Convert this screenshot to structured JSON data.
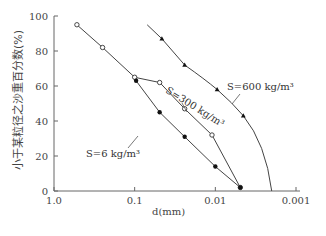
{
  "chart_data": {
    "type": "line",
    "title": "",
    "xlabel": "d(mm)",
    "ylabel": "小于某粒径之沙重百分数(%)",
    "x_scale": "log",
    "x_reversed": true,
    "xlim": [
      1.0,
      0.001
    ],
    "ylim": [
      0,
      100
    ],
    "x_ticks": [
      "1.0",
      "0.1",
      "0.01",
      "0.001"
    ],
    "y_ticks": [
      "0",
      "20",
      "40",
      "60",
      "80",
      "100"
    ],
    "grid": false,
    "legend": "none (inline annotations)",
    "series": [
      {
        "name": "S=300 kg/m³",
        "marker": "open-circle",
        "x": [
          0.52,
          0.25,
          0.1,
          0.049,
          0.024,
          0.011,
          0.0049
        ],
        "y": [
          95,
          82,
          65,
          62,
          47,
          32,
          2
        ]
      },
      {
        "name": "S=6 kg/m³",
        "marker": "filled-circle",
        "x": [
          0.096,
          0.049,
          0.024,
          0.01,
          0.0049
        ],
        "y": [
          63,
          45,
          31,
          14,
          2
        ]
      },
      {
        "name": "S=600 kg/m³",
        "marker": "filled-triangle",
        "x": [
          0.046,
          0.024,
          0.0095,
          0.0045,
          0.002
        ],
        "y": [
          87,
          72,
          58,
          43,
          0
        ]
      }
    ],
    "annotations": [
      {
        "text": "S=6 kg/m³",
        "near_series": "S=6 kg/m³"
      },
      {
        "text": "S=300 kg/m³",
        "near_series": "S=300 kg/m³"
      },
      {
        "text": "S=600 kg/m³",
        "near_series": "S=600 kg/m³"
      }
    ]
  },
  "labels": {
    "xlabel": "d(mm)",
    "ylabel": "小于某粒径之沙重百分数(%)",
    "annot_6": "S=6 kg/m³",
    "annot_300": "S=300 kg/m³",
    "annot_600": "S=600 kg/m³"
  }
}
